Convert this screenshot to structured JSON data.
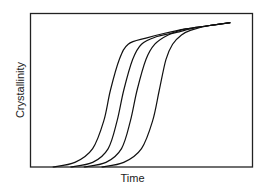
{
  "chart_data": {
    "type": "line",
    "title": "",
    "xlabel": "Time",
    "ylabel": "Crystallinity",
    "grid": false,
    "legend": null,
    "ticks": {
      "x": [],
      "y": []
    },
    "xlim": [
      0,
      1
    ],
    "ylim": [
      0,
      1
    ],
    "line_color": "#111111",
    "series": [
      {
        "name": "curve-1",
        "points": [
          [
            0.1,
            0.0
          ],
          [
            0.2,
            0.03
          ],
          [
            0.28,
            0.12
          ],
          [
            0.33,
            0.3
          ],
          [
            0.36,
            0.5
          ],
          [
            0.4,
            0.7
          ],
          [
            0.44,
            0.8
          ],
          [
            0.52,
            0.84
          ],
          [
            0.6,
            0.87
          ],
          [
            0.7,
            0.9
          ],
          [
            0.8,
            0.92
          ],
          [
            0.9,
            0.94
          ]
        ]
      },
      {
        "name": "curve-2",
        "points": [
          [
            0.18,
            0.0
          ],
          [
            0.28,
            0.03
          ],
          [
            0.35,
            0.12
          ],
          [
            0.39,
            0.3
          ],
          [
            0.42,
            0.5
          ],
          [
            0.46,
            0.7
          ],
          [
            0.5,
            0.8
          ],
          [
            0.57,
            0.85
          ],
          [
            0.63,
            0.87
          ],
          [
            0.7,
            0.9
          ],
          [
            0.8,
            0.92
          ],
          [
            0.9,
            0.94
          ]
        ]
      },
      {
        "name": "curve-3",
        "points": [
          [
            0.24,
            0.0
          ],
          [
            0.34,
            0.03
          ],
          [
            0.41,
            0.12
          ],
          [
            0.45,
            0.3
          ],
          [
            0.48,
            0.5
          ],
          [
            0.52,
            0.7
          ],
          [
            0.56,
            0.8
          ],
          [
            0.62,
            0.86
          ],
          [
            0.67,
            0.88
          ],
          [
            0.72,
            0.9
          ],
          [
            0.8,
            0.92
          ],
          [
            0.9,
            0.94
          ]
        ]
      },
      {
        "name": "curve-4",
        "points": [
          [
            0.32,
            0.0
          ],
          [
            0.42,
            0.03
          ],
          [
            0.5,
            0.12
          ],
          [
            0.55,
            0.3
          ],
          [
            0.58,
            0.5
          ],
          [
            0.61,
            0.7
          ],
          [
            0.64,
            0.8
          ],
          [
            0.68,
            0.86
          ],
          [
            0.72,
            0.89
          ],
          [
            0.8,
            0.92
          ],
          [
            0.9,
            0.94
          ]
        ]
      }
    ]
  },
  "labels": {
    "x": "Time",
    "y": "Crystallinity"
  }
}
